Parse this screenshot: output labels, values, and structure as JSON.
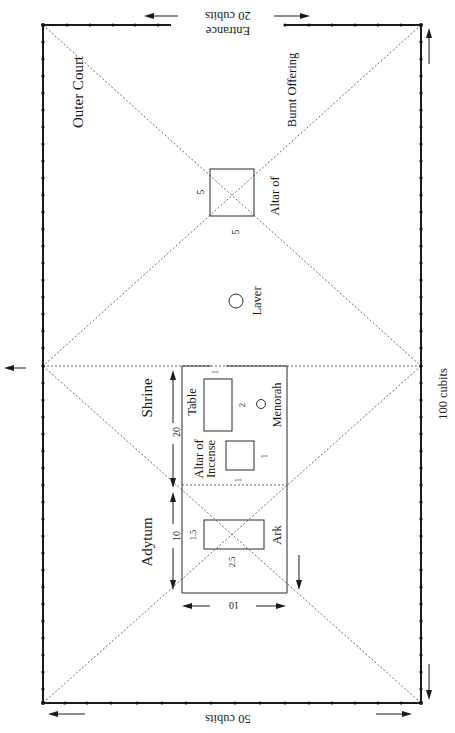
{
  "diagram": {
    "labels": {
      "outer_court": "Outer Court",
      "altar_burnt_line1": "Altar of",
      "altar_burnt_line2": "Burnt Offering",
      "altar_dim_side": "5",
      "altar_dim_bottom": "5",
      "laver": "Laver",
      "shrine": "Shrine",
      "shrine_length": "20",
      "table": "Table",
      "table_dim_short": "1",
      "table_dim_long": "2",
      "menorah": "Menorah",
      "incense_line1": "Altar of",
      "incense_line2": "Incense",
      "incense_dim_a": "1",
      "incense_dim_b": "1",
      "adytum": "Adytum",
      "adytum_length": "10",
      "ark": "Ark",
      "ark_dim_short": "1.5",
      "ark_dim_long": "2.5",
      "building_width": "10",
      "entrance_line1": "Entrance",
      "entrance_line2": "20 cubits",
      "court_width": "50 cubits",
      "court_length": "100 cubits"
    },
    "dimensions_cubits": {
      "court": {
        "length": 100,
        "width": 50
      },
      "entrance": 20,
      "shrine": {
        "length": 20,
        "width": 10
      },
      "adytum": {
        "length": 10,
        "width": 10
      },
      "altar_burnt_offering": {
        "length": 5,
        "width": 5
      },
      "table": {
        "length": 2,
        "width": 1
      },
      "altar_incense": {
        "length": 1,
        "width": 1
      },
      "ark": {
        "length": 2.5,
        "width": 1.5
      }
    },
    "colors": {
      "line": "#1a1a1a",
      "background": "#ffffff"
    }
  }
}
